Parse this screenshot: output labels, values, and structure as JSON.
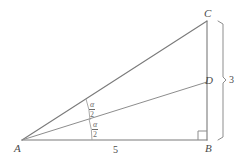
{
  "figure": {
    "kind": "geometry-diagram",
    "stroke_color": "#7a7a7a",
    "text_color": "#4a4a4a",
    "background_color": "#ffffff"
  },
  "vertices": [
    {
      "id": "A",
      "label": "A",
      "x": 22,
      "y": 140
    },
    {
      "id": "B",
      "label": "B",
      "x": 207,
      "y": 140
    },
    {
      "id": "C",
      "label": "C",
      "x": 207,
      "y": 21
    },
    {
      "id": "D",
      "label": "D",
      "x": 207,
      "y": 82
    }
  ],
  "vertex_labels": {
    "A": "A",
    "B": "B",
    "C": "C",
    "D": "D"
  },
  "segments": [
    {
      "name": "side-AB",
      "from": "A",
      "to": "B"
    },
    {
      "name": "side-AC",
      "from": "A",
      "to": "C"
    },
    {
      "name": "side-BC",
      "from": "B",
      "to": "C"
    },
    {
      "name": "cevian-AD",
      "from": "A",
      "to": "D"
    }
  ],
  "measures": {
    "ab_label": "5",
    "bc_label": "3"
  },
  "angles": [
    {
      "name": "upper-half-angle",
      "numerator": "α",
      "denominator": "2",
      "at_vertex": "A",
      "between": [
        "AD",
        "AC"
      ]
    },
    {
      "name": "lower-half-angle",
      "numerator": "α",
      "denominator": "2",
      "at_vertex": "A",
      "between": [
        "AB",
        "AD"
      ]
    }
  ],
  "markers": {
    "right_angle_vertex": "B",
    "right_angle_present": true,
    "brace_side": "BC",
    "brace_label": "3"
  }
}
